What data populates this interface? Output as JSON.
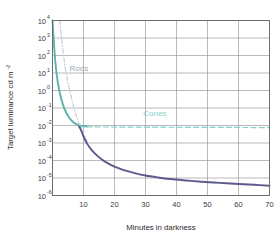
{
  "chart_data": {
    "type": "line",
    "title": "",
    "xlabel": "Minutes in darkness",
    "ylabel": "Target luminance cd m",
    "ylabel_exponent": "-2",
    "xlim": [
      0,
      70
    ],
    "ylim_log10": [
      -6,
      4
    ],
    "xticks": [
      10,
      20,
      30,
      40,
      50,
      60,
      70
    ],
    "xtick_labels": [
      "10",
      "20",
      "30",
      "40",
      "50",
      "60",
      "70"
    ],
    "ytick_mantissa": [
      "10",
      "10",
      "10",
      "10",
      "10",
      "10",
      "10",
      "10",
      "10",
      "10",
      "10"
    ],
    "ytick_exponents": [
      "4",
      "3",
      "2",
      "1",
      "0",
      "-1",
      "-2",
      "-3",
      "-4",
      "-5",
      "-6"
    ],
    "grid": true,
    "legend_position": "inline-annotations",
    "annotations": [
      {
        "text": "Rods",
        "x": 8.5,
        "y_log10": 1.1,
        "color": "#9aa7b4"
      },
      {
        "text": "Cones",
        "x": 33.0,
        "y_log10": -1.45,
        "color": "#86cfc8"
      }
    ],
    "series": [
      {
        "name": "Cone branch",
        "style": "solid",
        "color": "#5ab3ac",
        "points": [
          {
            "x": 0.0,
            "y_log10": 4.0
          },
          {
            "x": 0.35,
            "y_log10": 3.0
          },
          {
            "x": 0.7,
            "y_log10": 2.1
          },
          {
            "x": 1.1,
            "y_log10": 1.3
          },
          {
            "x": 1.6,
            "y_log10": 0.6
          },
          {
            "x": 2.2,
            "y_log10": 0.0
          },
          {
            "x": 3.0,
            "y_log10": -0.6
          },
          {
            "x": 4.0,
            "y_log10": -1.1
          },
          {
            "x": 5.2,
            "y_log10": -1.5
          },
          {
            "x": 6.6,
            "y_log10": -1.8
          },
          {
            "x": 8.0,
            "y_log10": -1.95
          },
          {
            "x": 9.5,
            "y_log10": -2.02
          },
          {
            "x": 11.0,
            "y_log10": -2.05
          }
        ]
      },
      {
        "name": "Rod branch (threshold)",
        "style": "dash-dot",
        "color": "#c3ccd6",
        "points": [
          {
            "x": 2.3,
            "y_log10": 4.0
          },
          {
            "x": 2.9,
            "y_log10": 3.0
          },
          {
            "x": 3.5,
            "y_log10": 2.1
          },
          {
            "x": 4.1,
            "y_log10": 1.3
          },
          {
            "x": 4.8,
            "y_log10": 0.6
          },
          {
            "x": 5.6,
            "y_log10": 0.0
          },
          {
            "x": 6.5,
            "y_log10": -0.7
          },
          {
            "x": 7.6,
            "y_log10": -1.4
          },
          {
            "x": 8.8,
            "y_log10": -2.0
          },
          {
            "x": 10.0,
            "y_log10": -2.5
          },
          {
            "x": 11.2,
            "y_log10": -2.9
          }
        ]
      },
      {
        "name": "Cone plateau",
        "style": "dashed",
        "color": "#7fd3cb",
        "points": [
          {
            "x": 8.5,
            "y_log10": -2.08
          },
          {
            "x": 70.0,
            "y_log10": -2.12
          }
        ]
      },
      {
        "name": "Dark adaptation curve",
        "style": "solid",
        "color": "#5b5a8c",
        "points": [
          {
            "x": 8.6,
            "y_log10": -2.05
          },
          {
            "x": 9.4,
            "y_log10": -2.35
          },
          {
            "x": 10.2,
            "y_log10": -2.7
          },
          {
            "x": 11.2,
            "y_log10": -3.05
          },
          {
            "x": 12.4,
            "y_log10": -3.35
          },
          {
            "x": 13.8,
            "y_log10": -3.62
          },
          {
            "x": 15.5,
            "y_log10": -3.88
          },
          {
            "x": 17.5,
            "y_log10": -4.12
          },
          {
            "x": 20.0,
            "y_log10": -4.35
          },
          {
            "x": 23.0,
            "y_log10": -4.55
          },
          {
            "x": 26.5,
            "y_log10": -4.72
          },
          {
            "x": 30.0,
            "y_log10": -4.86
          },
          {
            "x": 34.0,
            "y_log10": -4.97
          },
          {
            "x": 38.0,
            "y_log10": -5.06
          },
          {
            "x": 43.0,
            "y_log10": -5.14
          },
          {
            "x": 48.0,
            "y_log10": -5.21
          },
          {
            "x": 54.0,
            "y_log10": -5.28
          },
          {
            "x": 60.0,
            "y_log10": -5.34
          },
          {
            "x": 65.0,
            "y_log10": -5.39
          },
          {
            "x": 70.0,
            "y_log10": -5.44
          }
        ]
      }
    ],
    "colors": {
      "axis": "#6e6e6e",
      "grid": "#8b8b8b",
      "background": "#ffffff",
      "cone_curve": "#5ab3ac",
      "rod_curve": "#c3ccd6",
      "cone_plateau": "#7fd3cb",
      "adaptation_curve": "#5b5a8c"
    }
  }
}
